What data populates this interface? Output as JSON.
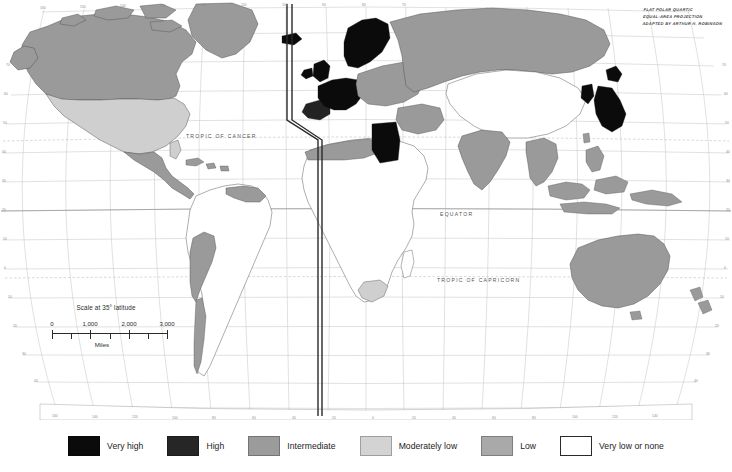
{
  "map": {
    "title_block": {
      "line1": "FLAT POLAR QUARTIC",
      "line2": "EQUAL-AREA PROJECTION",
      "line3": "ADAPTED BY ARTHUR H. ROBINSON"
    },
    "latitude_labels": [
      {
        "text": "TROPIC OF CANCER",
        "x": 186,
        "y": 138
      },
      {
        "text": "EQUATOR",
        "x": 440,
        "y": 215
      },
      {
        "text": "TROPIC OF CAPRICORN",
        "x": 437,
        "y": 281
      }
    ],
    "scale": {
      "title": "Scale at 35° latitude",
      "ticks": [
        "0",
        "1,000",
        "2,000",
        "3,000"
      ],
      "units": "Miles"
    },
    "graticule": {
      "longitude_labels_top": [
        "160",
        "150",
        "140",
        "130",
        "120",
        "110",
        "100",
        "90",
        "80",
        "70"
      ],
      "longitude_labels_bottom": [
        "160",
        "140",
        "120",
        "100",
        "80",
        "60",
        "40",
        "20",
        "0",
        "20",
        "40",
        "60",
        "80",
        "100",
        "120",
        "140",
        "160",
        "180"
      ],
      "latitude_values": [
        "80",
        "70",
        "60",
        "50",
        "40",
        "30",
        "20",
        "10",
        "0",
        "10",
        "20",
        "30",
        "40",
        "50",
        "60",
        "70"
      ]
    },
    "colors": {
      "very_high": "#0b0b0b",
      "high": "#232323",
      "intermediate": "#9a9a9a",
      "moderately_low": "#cfcfcf",
      "low": "#a8a8a8",
      "very_low": "#ffffff",
      "ocean": "#ffffff",
      "graticule_line": "#b9b9b9",
      "coastline": "#4a4a4a",
      "frame": "#2a2a2a"
    }
  },
  "legend": {
    "items": [
      {
        "label": "Very high",
        "color": "#0b0b0b",
        "outline": false
      },
      {
        "label": "High",
        "color": "#262626",
        "outline": false
      },
      {
        "label": "Intermediate",
        "color": "#9b9b9b",
        "outline": false
      },
      {
        "label": "Moderately low",
        "color": "#d3d3d3",
        "outline": false
      },
      {
        "label": "Low",
        "color": "#a9a9a9",
        "outline": false
      },
      {
        "label": "Very low or none",
        "color": "#ffffff",
        "outline": true
      }
    ]
  }
}
